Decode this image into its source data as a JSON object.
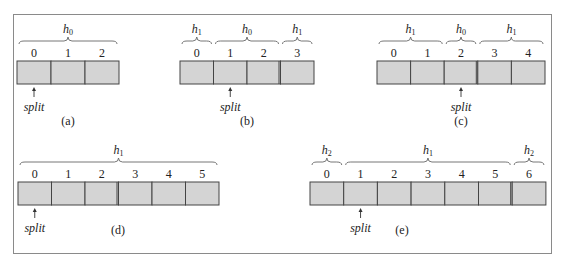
{
  "diagrams": [
    {
      "caption": "(a)",
      "x": 17,
      "y": 61,
      "cell_w": 34,
      "cell_h": 23,
      "labels": [
        "0",
        "1",
        "2"
      ],
      "double_after": [],
      "split_index": 0,
      "split_label": "split",
      "caption_x": 68,
      "caption_y": 125,
      "braces": [
        {
          "from": 0,
          "to": 3,
          "h": "h",
          "sub": "0"
        }
      ]
    },
    {
      "caption": "(b)",
      "x": 180,
      "y": 61,
      "cell_w": 33.5,
      "cell_h": 23,
      "labels": [
        "0",
        "1",
        "2",
        "3"
      ],
      "double_after": [
        2
      ],
      "split_index": 1,
      "split_label": "split",
      "caption_x": 247,
      "caption_y": 125,
      "braces": [
        {
          "from": 0,
          "to": 1,
          "h": "h",
          "sub": "1"
        },
        {
          "from": 1,
          "to": 3,
          "h": "h",
          "sub": "0"
        },
        {
          "from": 3,
          "to": 4,
          "h": "h",
          "sub": "1"
        }
      ]
    },
    {
      "caption": "(c)",
      "x": 377,
      "y": 61,
      "cell_w": 33.6,
      "cell_h": 23,
      "labels": [
        "0",
        "1",
        "2",
        "3",
        "4"
      ],
      "double_after": [
        2
      ],
      "split_index": 2,
      "split_label": "split",
      "caption_x": 461,
      "caption_y": 125,
      "braces": [
        {
          "from": 0,
          "to": 2,
          "h": "h",
          "sub": "1"
        },
        {
          "from": 2,
          "to": 3,
          "h": "h",
          "sub": "0"
        },
        {
          "from": 3,
          "to": 5,
          "h": "h",
          "sub": "1"
        }
      ]
    },
    {
      "caption": "(d)",
      "x": 18,
      "y": 182,
      "cell_w": 33.5,
      "cell_h": 23,
      "labels": [
        "0",
        "1",
        "2",
        "3",
        "4",
        "5"
      ],
      "double_after": [
        2
      ],
      "split_index": 0,
      "split_label": "split",
      "caption_x": 118,
      "caption_y": 234,
      "braces": [
        {
          "from": 0,
          "to": 6,
          "h": "h",
          "sub": "1"
        }
      ]
    },
    {
      "caption": "(e)",
      "x": 310,
      "y": 182,
      "cell_w": 33.7,
      "cell_h": 23,
      "labels": [
        "0",
        "1",
        "2",
        "3",
        "4",
        "5",
        "6"
      ],
      "double_after": [
        5
      ],
      "split_index": 1,
      "split_label": "split",
      "caption_x": 402,
      "caption_y": 234,
      "braces": [
        {
          "from": 0,
          "to": 1,
          "h": "h",
          "sub": "2"
        },
        {
          "from": 1,
          "to": 6,
          "h": "h",
          "sub": "1"
        },
        {
          "from": 6,
          "to": 7,
          "h": "h",
          "sub": "2"
        }
      ]
    }
  ],
  "colors": {
    "cell_fill": "#d4d4d4",
    "frame": "#8a8a8a"
  }
}
